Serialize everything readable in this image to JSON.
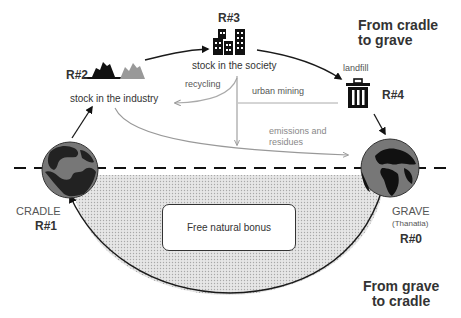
{
  "diagram": {
    "top_title": "From cradle\nto grave",
    "bottom_title": "From grave\nto cradle",
    "cradle": {
      "label": "CRADLE",
      "id": "R#1",
      "icon": "globe-icon"
    },
    "grave": {
      "label": "GRAVE",
      "sublabel": "(Thanatia)",
      "id": "R#0",
      "icon": "globe-icon"
    },
    "industry": {
      "id": "R#2",
      "label": "stock in the industry",
      "icon": "mountains-icon"
    },
    "society": {
      "id": "R#3",
      "label": "stock in the society",
      "icon": "buildings-icon"
    },
    "landfill": {
      "id": "R#4",
      "label": "landfill",
      "icon": "trash-can-icon"
    },
    "flows": {
      "recycling": "recycling",
      "urban_mining": "urban mining",
      "emissions_line1": "emissions and",
      "emissions_line2": "residues"
    },
    "natural_bonus": "Free natural bonus",
    "colors": {
      "dark": "#1a1a1a",
      "grey": "#999999",
      "light_grey": "#aaaaaa",
      "fill_dots": "#d4d4d4",
      "globe_land": "#111111",
      "globe_sea": "#777777"
    }
  }
}
